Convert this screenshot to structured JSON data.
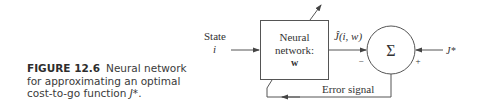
{
  "caption": {
    "figure_label": "FIGURE 12.6",
    "text_part1": "Neural network for approximating an optimal cost-to-go function",
    "text_math": "J*",
    "text_end": "."
  },
  "diagram": {
    "input_label_line1": "State",
    "input_label_line2": "i",
    "network_block": {
      "line1": "Neural",
      "line2": "network:",
      "line3": "w"
    },
    "output_label": "Ĵ(i, w)",
    "summing_junction": {
      "symbol": "Σ",
      "minus_sign": "−",
      "plus_sign": "+"
    },
    "target_label": "J*",
    "feedback_label": "Error signal"
  },
  "colors": {
    "line": "#555555",
    "text": "#333333",
    "caption": "#3a3a3a"
  }
}
